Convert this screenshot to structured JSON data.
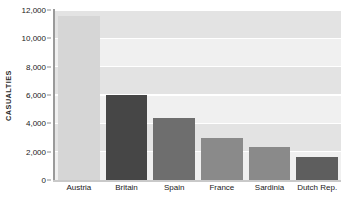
{
  "chart_data": {
    "type": "bar",
    "title": "",
    "subtitle": "",
    "xlabel": "",
    "ylabel": "CASUALTIES",
    "categories": [
      "Austria",
      "Britain",
      "Spain",
      "France",
      "Sardinia",
      "Dutch Rep."
    ],
    "values": [
      11600,
      6000,
      4400,
      3000,
      2300,
      1600
    ],
    "bar_colors": [
      "#d6d6d6",
      "#464646",
      "#6e6e6e",
      "#8a8a8a",
      "#8a8a8a",
      "#5e5e5e"
    ],
    "ylim": [
      0,
      12000
    ],
    "y_ticks": [
      0,
      2000,
      4000,
      6000,
      8000,
      10000,
      12000
    ],
    "y_tick_labels": [
      "0",
      "2,000",
      "4,000",
      "6,000",
      "8,000",
      "10,000",
      "12,000"
    ],
    "grid": true,
    "grid_color": "#ffffff",
    "legend": null,
    "legend_position": "none",
    "plot_background": "#f0f0f0",
    "band_color": "#e3e3e3",
    "axis_color": "#9a9a9a",
    "text_color": "#1a1a1a",
    "annotations": []
  }
}
